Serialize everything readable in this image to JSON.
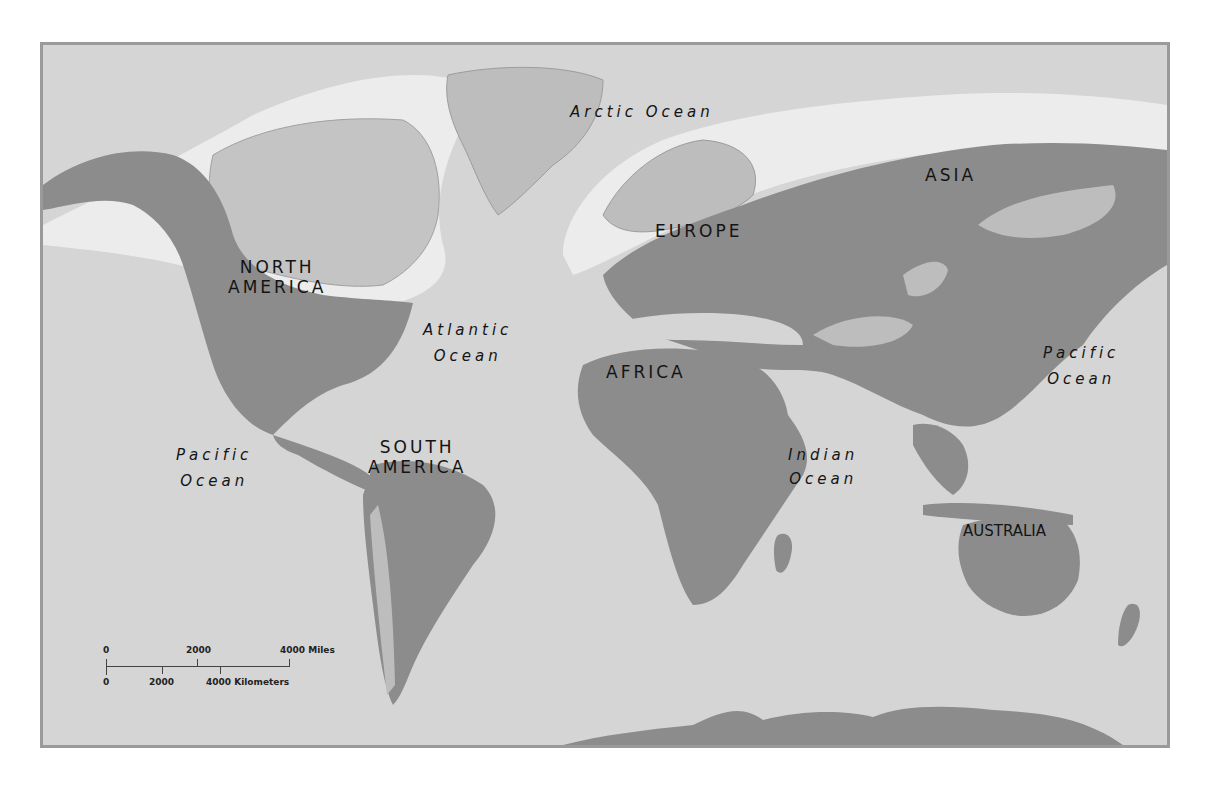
{
  "map": {
    "colors": {
      "ocean": "#d5d5d5",
      "land_other": "#bdbdbd",
      "range_highlight": "#8c8c8c",
      "ice": "#ececec",
      "frame_border": "#9a9a9a",
      "label_text": "#141414"
    },
    "continents": [
      {
        "id": "north-america",
        "line1": "NORTH",
        "line2": "AMERICA"
      },
      {
        "id": "south-america",
        "line1": "SOUTH",
        "line2": "AMERICA"
      },
      {
        "id": "europe",
        "line1": "EUROPE"
      },
      {
        "id": "africa",
        "line1": "AFRICA"
      },
      {
        "id": "asia",
        "line1": "ASIA"
      },
      {
        "id": "australia",
        "line1": "AUSTRALIA"
      }
    ],
    "oceans": [
      {
        "id": "arctic",
        "line1": "Arctic Ocean"
      },
      {
        "id": "atlantic",
        "line1": "Atlantic",
        "line2": "Ocean"
      },
      {
        "id": "pacific-west",
        "line1": "Pacific",
        "line2": "Ocean"
      },
      {
        "id": "pacific-east",
        "line1": "Pacific",
        "line2": "Ocean"
      },
      {
        "id": "indian",
        "line1": "Indian",
        "line2": "Ocean"
      }
    ],
    "scale_bar": {
      "miles": {
        "ticks": [
          "0",
          "2000",
          "4000 Miles"
        ]
      },
      "kilometers": {
        "ticks": [
          "0",
          "2000",
          "4000 Kilometers"
        ]
      }
    }
  }
}
